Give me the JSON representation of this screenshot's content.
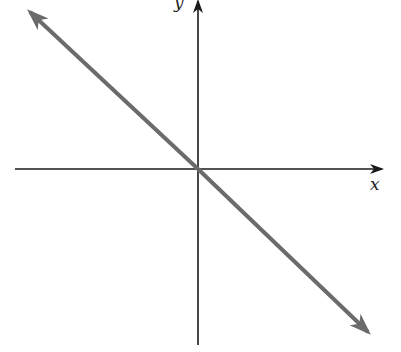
{
  "diagram": {
    "type": "coordinate-plane-line",
    "axes": {
      "x_label": "x",
      "y_label": "y",
      "axis_color": "#1a1a1a"
    },
    "line": {
      "description": "line through origin with negative slope, arrows at both ends",
      "slope_sign": "negative",
      "passes_through_origin": true,
      "color": "#6b6b6b"
    }
  }
}
